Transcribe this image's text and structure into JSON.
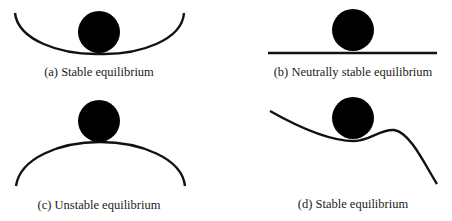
{
  "panels": [
    {
      "id": "a",
      "caption": "(a) Stable equilibrium",
      "surface": "concave-bowl"
    },
    {
      "id": "b",
      "caption": "(b) Neutrally stable equilibrium",
      "surface": "flat-line"
    },
    {
      "id": "c",
      "caption": "(c) Unstable equilibrium",
      "surface": "convex-hill"
    },
    {
      "id": "d",
      "caption": "(d) Stable equilibrium",
      "surface": "local-dip"
    }
  ],
  "colors": {
    "ball": "#000000",
    "line": "#111111",
    "text": "#222222",
    "background": "#ffffff"
  }
}
